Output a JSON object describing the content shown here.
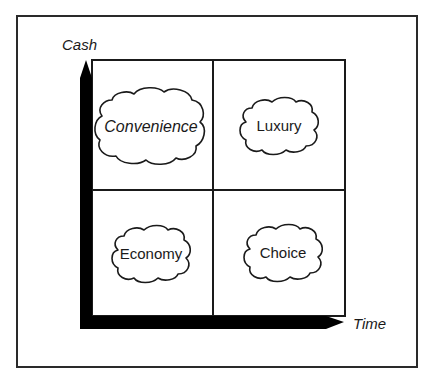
{
  "diagram": {
    "type": "2x2 matrix",
    "axes": {
      "y_label": "Cash",
      "x_label": "Time"
    },
    "quadrants": [
      {
        "position": "top-left",
        "label": "Convenience",
        "italic": true
      },
      {
        "position": "top-right",
        "label": "Luxury",
        "italic": false
      },
      {
        "position": "bottom-left",
        "label": "Economy",
        "italic": false
      },
      {
        "position": "bottom-right",
        "label": "Choice",
        "italic": false
      }
    ],
    "colors": {
      "stroke": "#1a1a1a",
      "axis_fill": "#000000",
      "background": "#ffffff"
    }
  }
}
